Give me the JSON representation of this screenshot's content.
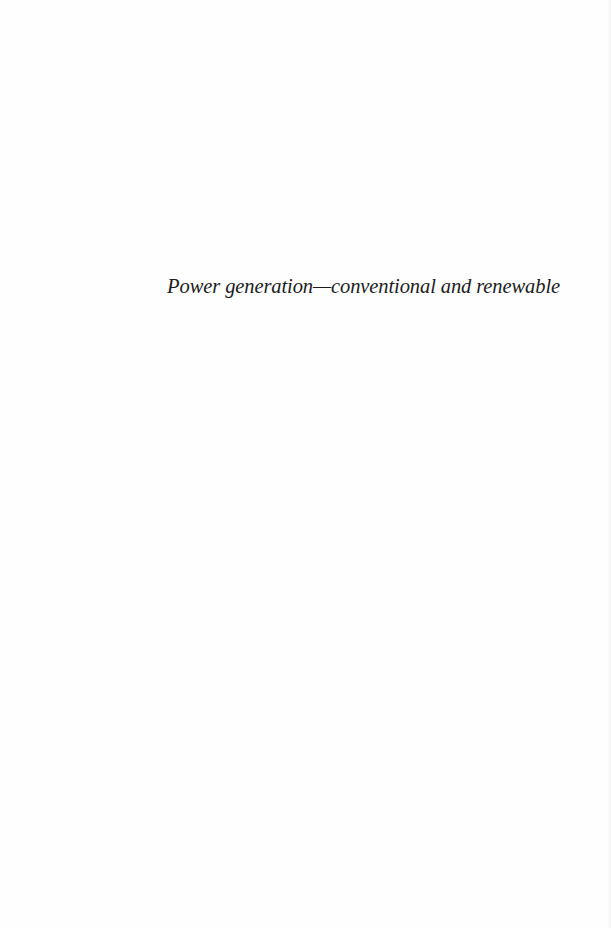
{
  "page": {
    "type": "half-title page",
    "background_color": "#fefefe",
    "text_color": "#1c1c1c"
  },
  "half_title": {
    "text": "Power generation—conventional and renewable"
  }
}
